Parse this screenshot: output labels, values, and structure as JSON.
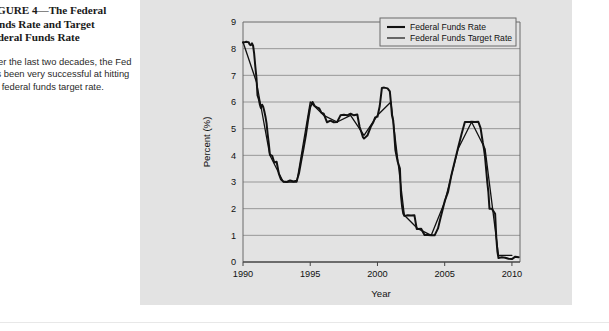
{
  "figure": {
    "caption_title": "FIGURE 4—The Federal\nFunds Rate and Target\nFederal Funds Rate",
    "caption_body": "Over the last two decades, the Fed\nhas been very successful at hitting\nthe federal funds target rate.",
    "panel_color": "#e3e3e3",
    "line_color": "#111111"
  },
  "chart_data": {
    "type": "line",
    "title": "",
    "xlabel": "Year",
    "ylabel": "Percent (%)",
    "xlim": [
      1990,
      2010.6
    ],
    "ylim": [
      0,
      9
    ],
    "xticks": [
      1990,
      1995,
      2000,
      2005,
      2010
    ],
    "yticks": [
      0,
      1,
      2,
      3,
      4,
      5,
      6,
      7,
      8,
      9
    ],
    "xtick_labels": [
      "1990",
      "1995",
      "2000",
      "2005",
      "2010"
    ],
    "ytick_labels": [
      "0",
      "1",
      "2",
      "3",
      "4",
      "5",
      "6",
      "7",
      "8",
      "9"
    ],
    "grid": "horizontal",
    "legend_position": "top-right",
    "legend": [
      "Federal Funds Rate",
      "Federal Funds Target Rate"
    ],
    "series": [
      {
        "name": "Federal Funds Rate",
        "x": [
          1990.0,
          1990.08,
          1990.17,
          1990.25,
          1990.33,
          1990.42,
          1990.5,
          1990.58,
          1990.67,
          1990.75,
          1990.83,
          1990.92,
          1991.0,
          1991.08,
          1991.17,
          1991.25,
          1991.33,
          1991.42,
          1991.5,
          1991.58,
          1991.67,
          1991.75,
          1991.83,
          1991.92,
          1992.0,
          1992.17,
          1992.33,
          1992.5,
          1992.67,
          1992.83,
          1993.0,
          1993.25,
          1993.5,
          1993.75,
          1994.0,
          1994.17,
          1994.33,
          1994.5,
          1994.67,
          1994.83,
          1995.0,
          1995.17,
          1995.33,
          1995.5,
          1995.67,
          1995.83,
          1996.0,
          1996.25,
          1996.5,
          1996.75,
          1997.0,
          1997.25,
          1997.5,
          1997.75,
          1998.0,
          1998.25,
          1998.5,
          1998.67,
          1998.83,
          1998.92,
          1999.0,
          1999.25,
          1999.5,
          1999.67,
          1999.83,
          2000.0,
          2000.17,
          2000.33,
          2000.5,
          2000.75,
          2000.92,
          2001.0,
          2001.08,
          2001.17,
          2001.25,
          2001.33,
          2001.42,
          2001.5,
          2001.67,
          2001.75,
          2001.83,
          2001.92,
          2002.0,
          2002.25,
          2002.5,
          2002.75,
          2002.92,
          2003.0,
          2003.25,
          2003.5,
          2003.75,
          2004.0,
          2004.25,
          2004.5,
          2004.67,
          2004.83,
          2005.0,
          2005.25,
          2005.5,
          2005.75,
          2006.0,
          2006.25,
          2006.5,
          2006.67,
          2006.83,
          2007.0,
          2007.25,
          2007.5,
          2007.67,
          2007.83,
          2007.92,
          2008.0,
          2008.17,
          2008.25,
          2008.33,
          2008.5,
          2008.75,
          2008.83,
          2008.92,
          2009.0,
          2009.25,
          2009.5,
          2009.75,
          2010.0,
          2010.25,
          2010.5
        ],
        "y": [
          8.23,
          8.24,
          8.25,
          8.26,
          8.25,
          8.24,
          8.15,
          8.13,
          8.2,
          8.11,
          7.81,
          7.31,
          6.91,
          6.25,
          6.12,
          5.91,
          5.78,
          5.9,
          5.82,
          5.66,
          5.45,
          5.21,
          4.81,
          4.43,
          4.03,
          3.98,
          3.73,
          3.76,
          3.3,
          3.09,
          3.02,
          3.0,
          3.06,
          3.02,
          3.05,
          3.34,
          3.79,
          4.25,
          4.74,
          5.29,
          5.81,
          6.0,
          5.85,
          5.8,
          5.76,
          5.6,
          5.56,
          5.24,
          5.3,
          5.24,
          5.25,
          5.5,
          5.52,
          5.5,
          5.56,
          5.5,
          5.53,
          5.07,
          4.83,
          4.68,
          4.63,
          4.74,
          5.07,
          5.22,
          5.42,
          5.45,
          5.85,
          6.53,
          6.54,
          6.51,
          6.4,
          5.98,
          5.49,
          5.31,
          4.8,
          4.21,
          3.97,
          3.77,
          3.5,
          2.49,
          2.09,
          1.82,
          1.73,
          1.75,
          1.74,
          1.75,
          1.24,
          1.24,
          1.25,
          1.01,
          1.01,
          1.0,
          1.0,
          1.26,
          1.61,
          1.93,
          2.28,
          2.63,
          3.26,
          3.78,
          4.29,
          4.79,
          5.25,
          5.25,
          5.25,
          5.26,
          5.25,
          5.26,
          5.02,
          4.49,
          4.24,
          3.94,
          2.98,
          2.61,
          2.0,
          2.0,
          1.81,
          0.97,
          0.39,
          0.15,
          0.18,
          0.16,
          0.12,
          0.11,
          0.2,
          0.18
        ]
      },
      {
        "name": "Federal Funds Target Rate",
        "x": [
          1990.0,
          1991.0,
          1992.0,
          1993.0,
          1994.0,
          1995.0,
          1996.0,
          1997.0,
          1998.0,
          1999.0,
          2000.0,
          2001.0,
          2002.0,
          2003.0,
          2004.0,
          2005.0,
          2006.0,
          2007.0,
          2008.0,
          2009.0,
          2010.0
        ],
        "y": [
          8.25,
          6.75,
          4.0,
          3.0,
          3.0,
          6.0,
          5.5,
          5.25,
          5.5,
          4.75,
          5.5,
          6.0,
          1.75,
          1.25,
          1.0,
          2.25,
          4.25,
          5.25,
          4.25,
          0.25,
          0.25
        ]
      }
    ],
    "note": "Both series are nearly coincident and are drawn as a single overlapping black trace."
  }
}
